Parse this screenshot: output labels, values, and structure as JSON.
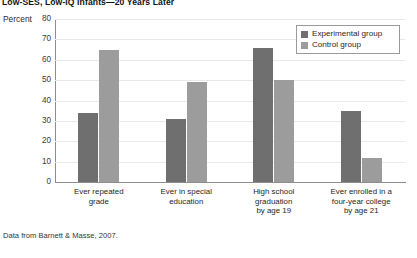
{
  "title": "Low-SES, Low-IQ Infants—20 Years Later",
  "axis_y_title": "Percent",
  "source_note": "Data from Barnett & Masse, 2007.",
  "legend": {
    "items": [
      {
        "label": "Experimental group",
        "color": "#6f6f6f",
        "swatch": "legend-swatch-experimental"
      },
      {
        "label": "Control group",
        "color": "#9c9c9c",
        "swatch": "legend-swatch-control"
      }
    ]
  },
  "categories_multiline": [
    [
      "Ever repeated",
      "grade"
    ],
    [
      "Ever in special",
      "education"
    ],
    [
      "High school",
      "graduation",
      "by age 19"
    ],
    [
      "Ever enrolled in a",
      "four-year college",
      "by age 21"
    ]
  ],
  "y_ticks": [
    "0",
    "10",
    "20",
    "30",
    "40",
    "50",
    "60",
    "70",
    "80"
  ],
  "chart_data": {
    "type": "bar",
    "title": "Low-SES, Low-IQ Infants—20 Years Later",
    "xlabel": "",
    "ylabel": "Percent",
    "ylim": [
      0,
      80
    ],
    "ytick_step": 10,
    "grid": true,
    "legend_position": "top-right",
    "categories": [
      "Ever repeated grade",
      "Ever in special education",
      "High school graduation by age 19",
      "Ever enrolled in a four-year college by age 21"
    ],
    "series": [
      {
        "name": "Experimental group",
        "color": "#6f6f6f",
        "values": [
          34,
          31,
          66,
          35
        ]
      },
      {
        "name": "Control group",
        "color": "#9c9c9c",
        "values": [
          65,
          49,
          50,
          12
        ]
      }
    ]
  }
}
